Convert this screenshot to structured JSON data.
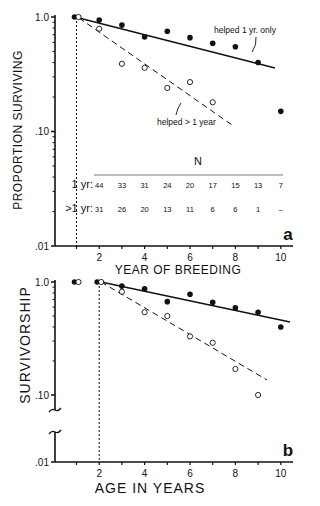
{
  "chart_data": [
    {
      "panel": "a",
      "type": "scatter",
      "title": "",
      "xlabel": "YEAR OF BREEDING",
      "ylabel": "PROPORTION SURVIVING",
      "yscale": "log",
      "ylim": [
        0.01,
        1.0
      ],
      "xlim": [
        0.5,
        10.8
      ],
      "y_ticks": [
        "1.0",
        ".10",
        ".01"
      ],
      "x_ticks": [
        "2",
        "4",
        "6",
        "8",
        "10"
      ],
      "panel_label": "a",
      "series": [
        {
          "name": "helped 1 yr. only",
          "marker": "filled",
          "line": "solid",
          "x": [
            1,
            2,
            3,
            4,
            5,
            6,
            7,
            8,
            9,
            10
          ],
          "values": [
            1.0,
            0.94,
            0.85,
            0.67,
            0.75,
            0.66,
            0.59,
            0.55,
            0.4,
            0.15
          ]
        },
        {
          "name": "helped > 1 year",
          "marker": "open",
          "line": "dashed",
          "x": [
            1,
            2,
            3,
            4,
            5,
            6,
            7
          ],
          "values": [
            1.0,
            0.79,
            0.39,
            0.36,
            0.24,
            0.27,
            0.18
          ]
        }
      ],
      "annotations": [
        "helped 1 yr. only",
        "helped > 1 year"
      ],
      "n_table": {
        "header": "N",
        "rows": [
          {
            "label": "1 yr:",
            "values": [
              "44",
              "33",
              "31",
              "24",
              "20",
              "17",
              "15",
              "13",
              "7"
            ]
          },
          {
            "label": ">1 yr:",
            "values": [
              "31",
              "26",
              "20",
              "13",
              "11",
              "6",
              "6",
              "1",
              "–"
            ]
          }
        ]
      }
    },
    {
      "panel": "b",
      "type": "scatter",
      "title": "",
      "xlabel": "AGE IN YEARS",
      "ylabel": "SURVIVORSHIP",
      "yscale": "log",
      "ylim": [
        0.01,
        1.0
      ],
      "y_axis_break": true,
      "y_ticks": [
        "1.0",
        ".10",
        ".01"
      ],
      "x_ticks": [
        "2",
        "4",
        "6",
        "8",
        "10"
      ],
      "panel_label": "b",
      "series": [
        {
          "name": "helped 1 yr. only",
          "marker": "filled",
          "line": "solid",
          "x": [
            1,
            2,
            3,
            4,
            5,
            6,
            7,
            8,
            9,
            10
          ],
          "values": [
            1.0,
            1.0,
            0.92,
            0.87,
            0.67,
            0.78,
            0.66,
            0.59,
            0.54,
            0.4
          ]
        },
        {
          "name": "helped > 1 year",
          "marker": "open",
          "line": "dashed",
          "x": [
            1,
            2,
            3,
            4,
            5,
            6,
            7,
            8,
            9
          ],
          "values": [
            1.0,
            1.0,
            0.82,
            0.54,
            0.5,
            0.33,
            0.29,
            0.17,
            0.1
          ]
        }
      ]
    }
  ]
}
